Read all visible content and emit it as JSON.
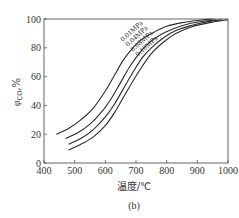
{
  "chart_data": {
    "type": "line",
    "title": "",
    "caption": "(b)",
    "xlabel": "温度/℃",
    "ylabel": "φCO,%",
    "ylabel_main": "φ",
    "ylabel_sub": "CO",
    "ylabel_suffix": ",%",
    "xlim": [
      400,
      1000
    ],
    "ylim": [
      0,
      100
    ],
    "xticks": [
      400,
      500,
      600,
      700,
      800,
      900,
      1000
    ],
    "yticks": [
      0,
      20,
      40,
      60,
      80,
      100
    ],
    "grid": false,
    "legend": "inline curve labels",
    "series": [
      {
        "name": "0.01MPa",
        "x": [
          440,
          480,
          520,
          560,
          600,
          630,
          660,
          690,
          720,
          760,
          800,
          850,
          900,
          950
        ],
        "y": [
          20,
          24,
          30,
          38,
          50,
          61,
          72,
          80,
          86,
          91,
          95,
          97.5,
          99,
          100
        ]
      },
      {
        "name": "0.04MPa",
        "x": [
          470,
          510,
          550,
          590,
          620,
          650,
          680,
          710,
          740,
          780,
          820,
          870,
          920,
          960
        ],
        "y": [
          17,
          21,
          27,
          36,
          45,
          56,
          67,
          76,
          83,
          89,
          93,
          96.5,
          98.5,
          99.5
        ]
      },
      {
        "name": "0.08MPa",
        "x": [
          480,
          520,
          560,
          600,
          630,
          660,
          690,
          720,
          750,
          790,
          830,
          880,
          930,
          980
        ],
        "y": [
          13,
          17,
          23,
          32,
          41,
          52,
          63,
          73,
          80,
          87,
          92,
          95.5,
          98,
          99.5
        ]
      },
      {
        "name": "0.10MPa",
        "x": [
          480,
          520,
          560,
          600,
          630,
          660,
          690,
          720,
          750,
          790,
          830,
          880,
          940,
          1000
        ],
        "y": [
          9,
          13,
          18,
          26,
          35,
          46,
          57,
          67,
          76,
          84,
          90,
          94.5,
          97.5,
          99.5
        ]
      }
    ]
  },
  "plot_area": {
    "left": 44,
    "right": 228,
    "top": 19,
    "bottom": 163
  },
  "colors": {
    "line": "#2a2a2a",
    "axis": "#555555",
    "text": "#333333"
  }
}
